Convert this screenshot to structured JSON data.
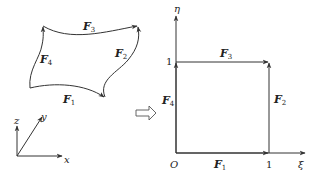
{
  "physical_domain": {
    "edges": [
      {
        "name": "F",
        "sub": "1"
      },
      {
        "name": "F",
        "sub": "2"
      },
      {
        "name": "F",
        "sub": "3"
      },
      {
        "name": "F",
        "sub": "4"
      }
    ],
    "axes": {
      "x": "x",
      "y": "y",
      "z": "z"
    }
  },
  "mapping_arrow": "hollow-right-arrow",
  "reference_domain": {
    "origin": "O",
    "xi_axis": "ξ",
    "eta_axis": "η",
    "xi_tick": "1",
    "eta_tick": "1",
    "edges": [
      {
        "name": "F",
        "sub": "1"
      },
      {
        "name": "F",
        "sub": "2"
      },
      {
        "name": "F",
        "sub": "3"
      },
      {
        "name": "F",
        "sub": "4"
      }
    ]
  },
  "colors": {
    "stroke": "#333333",
    "text": "#222222"
  }
}
